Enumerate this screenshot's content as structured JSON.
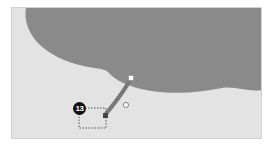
{
  "canvas": {
    "background_color": "#e3e3e3",
    "cloud_color": "#8a8a8a",
    "tail_color": "#7d7d7d"
  },
  "callout": {
    "step_number": "13",
    "shape": "cloud-callout",
    "handles": {
      "tail_tip": "square-handle",
      "tail_adjust": "round-handle",
      "anchor": "dark-square-handle"
    }
  },
  "selection": {
    "style": "dotted-rectangle"
  }
}
